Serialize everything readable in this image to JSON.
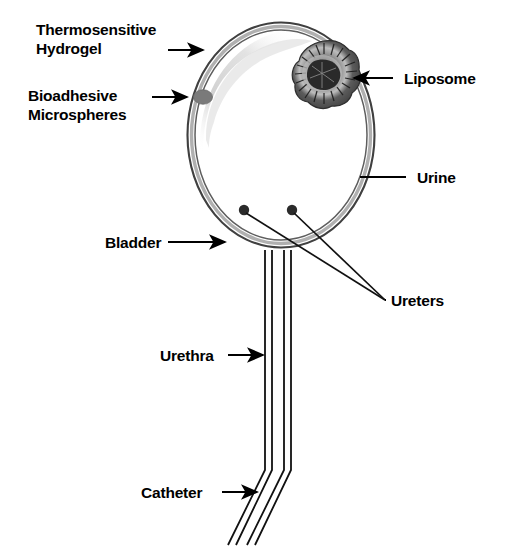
{
  "figure": {
    "type": "anatomical-diagram",
    "background_color": "#ffffff",
    "ink_color": "#000000"
  },
  "labels": {
    "thermosensitive_hydrogel": "Thermosensitive\nHydrogel",
    "bioadhesive_microspheres": "Bioadhesive\nMicrospheres",
    "bladder": "Bladder",
    "urethra": "Urethra",
    "catheter": "Catheter",
    "liposome": "Liposome",
    "urine": "Urine",
    "ureters": "Ureters"
  },
  "structures": {
    "bladder": {
      "name": "bladder-outline",
      "shape": "oval",
      "center_x": 281,
      "center_y": 135,
      "radius_x": 94,
      "radius_y": 113,
      "wall_outer_color": "#3a3a3a",
      "wall_inner_color": "#b4b4b4",
      "fill_color": "#ffffff"
    },
    "liposome": {
      "name": "liposome-particle",
      "center_x": 324,
      "center_y": 73,
      "radius": 32,
      "outer_color": "#4a4a4a",
      "ring_color": "#a8a8a8",
      "core_color": "#2b2b2b"
    },
    "microsphere": {
      "name": "bioadhesive-microsphere",
      "center_x": 203,
      "center_y": 97,
      "radius_x": 9,
      "radius_y": 7,
      "color": "#7d7d7d"
    },
    "hydrogel": {
      "name": "thermosensitive-hydrogel-layer",
      "color": "#d5d5d5",
      "location": "inner upper-left bladder wall"
    },
    "ureters": [
      {
        "dot_x": 244,
        "dot_y": 210,
        "dot_radius": 5
      },
      {
        "dot_x": 292,
        "dot_y": 210,
        "dot_radius": 5
      }
    ],
    "urethra": {
      "name": "urethra-tube",
      "top_y": 248,
      "bottom_y": 470,
      "line_x": [
        265,
        272,
        284,
        291
      ]
    },
    "catheter": {
      "name": "catheter-tube",
      "bend_y": 470,
      "end_x": 228,
      "end_y": 545
    }
  },
  "leaders": {
    "thermosensitive_hydrogel": {
      "arrow": true,
      "from_x": 168,
      "from_y": 50,
      "to_x": 202,
      "to_y": 50
    },
    "bioadhesive_microspheres": {
      "arrow": true,
      "from_x": 152,
      "from_y": 97,
      "to_x": 186,
      "to_y": 97
    },
    "bladder": {
      "arrow": true,
      "from_x": 168,
      "from_y": 242,
      "to_x": 224,
      "to_y": 242
    },
    "urethra": {
      "arrow": true,
      "from_x": 228,
      "from_y": 355,
      "to_x": 262,
      "to_y": 355
    },
    "catheter": {
      "arrow": true,
      "from_x": 222,
      "from_y": 492,
      "to_x": 256,
      "to_y": 492
    },
    "liposome": {
      "arrow": true,
      "from_x": 392,
      "from_y": 78,
      "to_x": 352,
      "to_y": 78
    },
    "urine": {
      "arrow": false,
      "from_x": 406,
      "from_y": 177,
      "to_x": 360,
      "to_y": 177
    },
    "ureters": {
      "arrow": false,
      "converge_x": 385,
      "converge_y": 300
    }
  }
}
